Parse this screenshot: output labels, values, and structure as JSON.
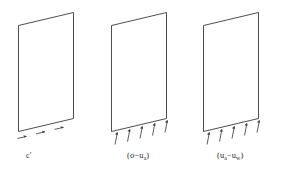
{
  "figure": {
    "name": "shear-strength-components",
    "background_color": "#ffffff",
    "line_color": "#3a3a3a",
    "arrow_color": "#3f3f3f",
    "panel_count": 3
  },
  "panels": [
    {
      "id": "panel-cohesion",
      "label_plain": "c'",
      "label_main": "c",
      "label_prime": "′",
      "label_sub": "",
      "arrow_count": 3,
      "arrow_style": "in-plane-parallel"
    },
    {
      "id": "panel-net-normal-stress",
      "label_plain": "(σ−uₐ)",
      "label_open": "(",
      "label_main": "σ",
      "label_minus": "−",
      "label_second": "u",
      "label_sub": "a",
      "label_close": ")",
      "arrow_count": 5,
      "arrow_style": "perpendicular-to-base"
    },
    {
      "id": "panel-matric-suction",
      "label_plain": "(uₐ−uᵥᵥ)",
      "label_open": "(",
      "label_main": "u",
      "label_sub": "a",
      "label_minus": "−",
      "label_second": "u",
      "label_sub2": "w",
      "label_close": ")",
      "arrow_count": 5,
      "arrow_style": "perpendicular-to-base"
    }
  ],
  "captions": {
    "cohesion": "c′",
    "net_normal_stress_open": "(",
    "net_normal_stress_sigma": "σ",
    "net_normal_stress_minus": "−",
    "net_normal_stress_u": "u",
    "net_normal_stress_sub": "a",
    "net_normal_stress_close": ")",
    "matric_suction_open": "(",
    "matric_suction_u1": "u",
    "matric_suction_sub1": "a",
    "matric_suction_minus": "−",
    "matric_suction_u2": "u",
    "matric_suction_sub2": "w",
    "matric_suction_close": ")"
  }
}
